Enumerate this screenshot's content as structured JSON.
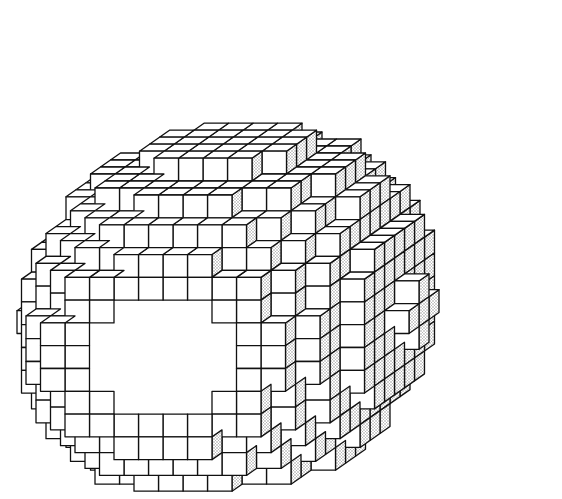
{
  "figure": {
    "colors": {
      "background": "#ffffff",
      "line": "#111111",
      "front_face": "#ffffff",
      "top_face": "#ffffff",
      "side_face": "#d9d9d9"
    },
    "geometry": {
      "cell": 24.5,
      "depth_dx": 10,
      "depth_dy": -7,
      "front_origin_x": 37,
      "front_origin_y": 160,
      "front_rows": [
        {
          "row": 0,
          "x0": 5,
          "x1": 14,
          "layer": 5
        },
        {
          "row": 1,
          "x0": 3,
          "x1": 14,
          "layer": 4
        },
        {
          "row": 2,
          "x0": 2,
          "x1": 14,
          "layer": 3
        },
        {
          "row": 3,
          "x0": 1,
          "x1": 14,
          "layer": 2
        },
        {
          "row": 4,
          "x0": 0,
          "x1": 15,
          "layer": 0
        },
        {
          "row": 5,
          "x0": 0,
          "x1": 15,
          "layer": 0
        },
        {
          "row": 6,
          "x0": 0,
          "x1": 15,
          "layer": 0
        },
        {
          "row": 7,
          "x0": 0,
          "x1": 15,
          "layer": 0
        },
        {
          "row": 8,
          "x0": 0,
          "x1": 15,
          "layer": 0
        },
        {
          "row": 9,
          "x0": 0,
          "x1": 15,
          "layer": 0
        },
        {
          "row": 10,
          "x0": 1,
          "x1": 15,
          "layer": 1
        },
        {
          "row": 11,
          "x0": 2,
          "x1": 14,
          "layer": 2
        },
        {
          "row": 12,
          "x0": 3,
          "x1": 13,
          "layer": 3
        }
      ],
      "layers": 6
    }
  }
}
